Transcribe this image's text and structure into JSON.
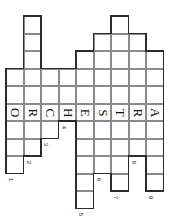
{
  "puzzle": {
    "type": "crossword-grid",
    "orientation": "rotated-90-clockwise",
    "cell_size": 17.5,
    "origin": {
      "x": 6,
      "y": 16
    },
    "columns": 9,
    "rows": 12,
    "answer_row_index": 5,
    "answer_word": "ORCHESTRA",
    "letters": [
      {
        "index": 0,
        "char": "O",
        "col": 0
      },
      {
        "index": 1,
        "char": "R",
        "col": 1
      },
      {
        "index": 2,
        "char": "C",
        "col": 2
      },
      {
        "index": 3,
        "char": "H",
        "col": 3
      },
      {
        "index": 4,
        "char": "E",
        "col": 4
      },
      {
        "index": 5,
        "char": "S",
        "col": 5
      },
      {
        "index": 6,
        "char": "T",
        "col": 6
      },
      {
        "index": 7,
        "char": "R",
        "col": 7
      },
      {
        "index": 8,
        "char": "A",
        "col": 8
      }
    ],
    "clue_numbers": [
      {
        "label": "1",
        "col": 0
      },
      {
        "label": "2",
        "col": 1
      },
      {
        "label": "3",
        "col": 2
      },
      {
        "label": "4",
        "col": 3
      },
      {
        "label": "5",
        "col": 4
      },
      {
        "label": "6",
        "col": 5
      },
      {
        "label": "7",
        "col": 6
      },
      {
        "label": "8",
        "col": 7
      },
      {
        "label": "9",
        "col": 8
      }
    ],
    "column_spans": [
      {
        "col": 0,
        "start_row": 3,
        "end_row": 8,
        "length": 6
      },
      {
        "col": 1,
        "start_row": 0,
        "end_row": 7,
        "length": 8
      },
      {
        "col": 2,
        "start_row": 3,
        "end_row": 6,
        "length": 4
      },
      {
        "col": 3,
        "start_row": 3,
        "end_row": 5,
        "length": 3
      },
      {
        "col": 4,
        "start_row": 2,
        "end_row": 10,
        "length": 9
      },
      {
        "col": 5,
        "start_row": 1,
        "end_row": 8,
        "length": 8
      },
      {
        "col": 6,
        "start_row": 0,
        "end_row": 9,
        "length": 10
      },
      {
        "col": 7,
        "start_row": 1,
        "end_row": 7,
        "length": 7
      },
      {
        "col": 8,
        "start_row": 2,
        "end_row": 9,
        "length": 8
      }
    ],
    "colors": {
      "grid_line": "#8a8a8a",
      "outline": "#2b2b2b",
      "cell_fill": "#ffffff",
      "text": "#111111",
      "page_background": "#ffffff"
    }
  }
}
